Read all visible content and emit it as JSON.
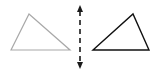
{
  "diagram": {
    "type": "reflection",
    "width": 158,
    "height": 74,
    "background": "#ffffff",
    "original_shape": {
      "kind": "triangle",
      "points": [
        [
          11,
          50
        ],
        [
          29,
          14
        ],
        [
          70,
          50
        ]
      ],
      "stroke": "#a8a8a8",
      "stroke_width": 1.2
    },
    "mirror_line": {
      "kind": "dashed-double-arrow",
      "x": 80,
      "y1": 5,
      "y2": 69,
      "stroke": "#1a1a1a",
      "stroke_width": 1.6,
      "dash": "5,4"
    },
    "reflected_shape": {
      "kind": "triangle",
      "points": [
        [
          93,
          50
        ],
        [
          133,
          14
        ],
        [
          149,
          50
        ]
      ],
      "stroke": "#111111",
      "stroke_width": 1.4
    }
  }
}
